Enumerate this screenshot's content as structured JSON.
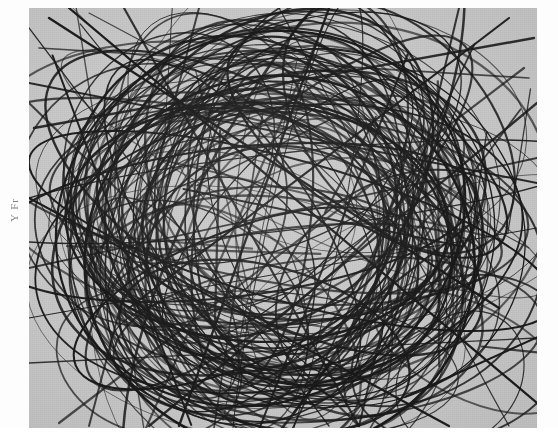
{
  "figure": {
    "kind": "line-arrangement-plot",
    "ylabel": "Y Fr",
    "panel": {
      "x": 29,
      "y": 8,
      "width": 508,
      "height": 420,
      "background_color": "#c9c9c9"
    },
    "page_background_color": "#fdfdfd",
    "curve_color": "#1a1a1a"
  },
  "chart_data": {
    "type": "line",
    "title": "",
    "subtitle": "",
    "xlabel": "",
    "ylabel": "Y Fr",
    "xlim": [
      0,
      508
    ],
    "ylim": [
      0,
      420
    ],
    "grid": false,
    "legend": null,
    "tick_labels": {
      "x": [],
      "y": []
    },
    "annotations": [],
    "series": [
      {
        "name": "ellipse-01",
        "type": "ellipse",
        "cx": 250,
        "cy": 205,
        "rx": 205,
        "ry": 160,
        "rot": 12
      },
      {
        "name": "ellipse-02",
        "type": "ellipse",
        "cx": 240,
        "cy": 215,
        "rx": 225,
        "ry": 140,
        "rot": -20
      },
      {
        "name": "ellipse-03",
        "type": "ellipse",
        "cx": 265,
        "cy": 190,
        "rx": 190,
        "ry": 178,
        "rot": 48
      },
      {
        "name": "ellipse-04",
        "type": "ellipse",
        "cx": 225,
        "cy": 230,
        "rx": 235,
        "ry": 120,
        "rot": 70
      },
      {
        "name": "ellipse-05",
        "type": "ellipse",
        "cx": 270,
        "cy": 225,
        "rx": 170,
        "ry": 185,
        "rot": -55
      },
      {
        "name": "ellipse-06",
        "type": "ellipse",
        "cx": 235,
        "cy": 195,
        "rx": 245,
        "ry": 105,
        "rot": 30
      },
      {
        "name": "ellipse-07",
        "type": "ellipse",
        "cx": 255,
        "cy": 240,
        "rx": 200,
        "ry": 150,
        "rot": -8
      },
      {
        "name": "ellipse-08",
        "type": "ellipse",
        "cx": 245,
        "cy": 180,
        "rx": 160,
        "ry": 190,
        "rot": 85
      },
      {
        "name": "ellipse-09",
        "type": "ellipse",
        "cx": 275,
        "cy": 210,
        "rx": 215,
        "ry": 135,
        "rot": 60
      },
      {
        "name": "ellipse-10",
        "type": "ellipse",
        "cx": 215,
        "cy": 220,
        "rx": 180,
        "ry": 170,
        "rot": -38
      },
      {
        "name": "ellipse-11",
        "type": "ellipse",
        "cx": 260,
        "cy": 200,
        "rx": 240,
        "ry": 95,
        "rot": 5
      },
      {
        "name": "ellipse-12",
        "type": "ellipse",
        "cx": 230,
        "cy": 245,
        "rx": 150,
        "ry": 175,
        "rot": 22
      },
      {
        "name": "ellipse-13",
        "type": "ellipse",
        "cx": 280,
        "cy": 235,
        "rx": 195,
        "ry": 145,
        "rot": -70
      },
      {
        "name": "ellipse-14",
        "type": "ellipse",
        "cx": 205,
        "cy": 190,
        "rx": 165,
        "ry": 160,
        "rot": 40
      },
      {
        "name": "ellipse-15",
        "type": "ellipse",
        "cx": 265,
        "cy": 260,
        "rx": 210,
        "ry": 125,
        "rot": 15
      },
      {
        "name": "ellipse-16",
        "type": "ellipse",
        "cx": 240,
        "cy": 165,
        "rx": 185,
        "ry": 140,
        "rot": -45
      },
      {
        "name": "ellipse-17",
        "type": "ellipse",
        "cx": 300,
        "cy": 215,
        "rx": 175,
        "ry": 165,
        "rot": 75
      },
      {
        "name": "ellipse-18",
        "type": "ellipse",
        "cx": 195,
        "cy": 250,
        "rx": 155,
        "ry": 150,
        "rot": -15
      },
      {
        "name": "ellipse-19",
        "type": "ellipse",
        "cx": 255,
        "cy": 300,
        "rx": 200,
        "ry": 110,
        "rot": 8
      },
      {
        "name": "ellipse-20",
        "type": "ellipse",
        "cx": 250,
        "cy": 130,
        "rx": 195,
        "ry": 105,
        "rot": -25
      },
      {
        "name": "ellipse-21",
        "type": "ellipse",
        "cx": 160,
        "cy": 300,
        "rx": 130,
        "ry": 95,
        "rot": 35
      },
      {
        "name": "ellipse-22",
        "type": "ellipse",
        "cx": 380,
        "cy": 280,
        "rx": 140,
        "ry": 110,
        "rot": -30
      },
      {
        "name": "ellipse-23",
        "type": "ellipse",
        "cx": 370,
        "cy": 120,
        "rx": 145,
        "ry": 90,
        "rot": 50
      },
      {
        "name": "ellipse-24",
        "type": "ellipse",
        "cx": 140,
        "cy": 140,
        "rx": 120,
        "ry": 100,
        "rot": -60
      },
      {
        "name": "ellipse-25",
        "type": "ellipse",
        "cx": 255,
        "cy": 355,
        "rx": 175,
        "ry": 70,
        "rot": 6
      },
      {
        "name": "ellipse-26",
        "type": "ellipse",
        "cx": 120,
        "cy": 355,
        "rx": 95,
        "ry": 70,
        "rot": 20
      },
      {
        "name": "ellipse-27",
        "type": "ellipse",
        "cx": 430,
        "cy": 350,
        "rx": 110,
        "ry": 80,
        "rot": -18
      },
      {
        "name": "ellipse-28",
        "type": "ellipse",
        "cx": 250,
        "cy": 205,
        "rx": 120,
        "ry": 195,
        "rot": 10
      },
      {
        "name": "ellipse-29",
        "type": "ellipse",
        "cx": 250,
        "cy": 205,
        "rx": 250,
        "ry": 80,
        "rot": -42
      },
      {
        "name": "ellipse-30",
        "type": "ellipse",
        "cx": 250,
        "cy": 205,
        "rx": 90,
        "ry": 200,
        "rot": 65
      }
    ],
    "chords": [
      {
        "x1": 10,
        "y1": 40,
        "x2": 500,
        "y2": 70
      },
      {
        "x1": 5,
        "y1": 120,
        "x2": 505,
        "y2": 30
      },
      {
        "x1": 20,
        "y1": 10,
        "x2": 470,
        "y2": 300
      },
      {
        "x1": 60,
        "y1": 5,
        "x2": 500,
        "y2": 240
      },
      {
        "x1": 0,
        "y1": 260,
        "x2": 508,
        "y2": 150
      },
      {
        "x1": 0,
        "y1": 310,
        "x2": 508,
        "y2": 220
      },
      {
        "x1": 30,
        "y1": 415,
        "x2": 495,
        "y2": 60
      },
      {
        "x1": 120,
        "y1": 418,
        "x2": 508,
        "y2": 95
      },
      {
        "x1": 0,
        "y1": 190,
        "x2": 420,
        "y2": 418
      },
      {
        "x1": 0,
        "y1": 95,
        "x2": 330,
        "y2": 418
      },
      {
        "x1": 170,
        "y1": 0,
        "x2": 60,
        "y2": 418
      },
      {
        "x1": 300,
        "y1": 0,
        "x2": 150,
        "y2": 418
      },
      {
        "x1": 95,
        "y1": 0,
        "x2": 330,
        "y2": 418
      },
      {
        "x1": 430,
        "y1": 0,
        "x2": 330,
        "y2": 418
      },
      {
        "x1": 0,
        "y1": 355,
        "x2": 508,
        "y2": 330
      },
      {
        "x1": 0,
        "y1": 75,
        "x2": 508,
        "y2": 175
      },
      {
        "x1": 250,
        "y1": 0,
        "x2": 480,
        "y2": 418
      },
      {
        "x1": 40,
        "y1": 0,
        "x2": 508,
        "y2": 395
      },
      {
        "x1": 0,
        "y1": 20,
        "x2": 300,
        "y2": 418
      },
      {
        "x1": 480,
        "y1": 10,
        "x2": 100,
        "y2": 300
      }
    ]
  }
}
